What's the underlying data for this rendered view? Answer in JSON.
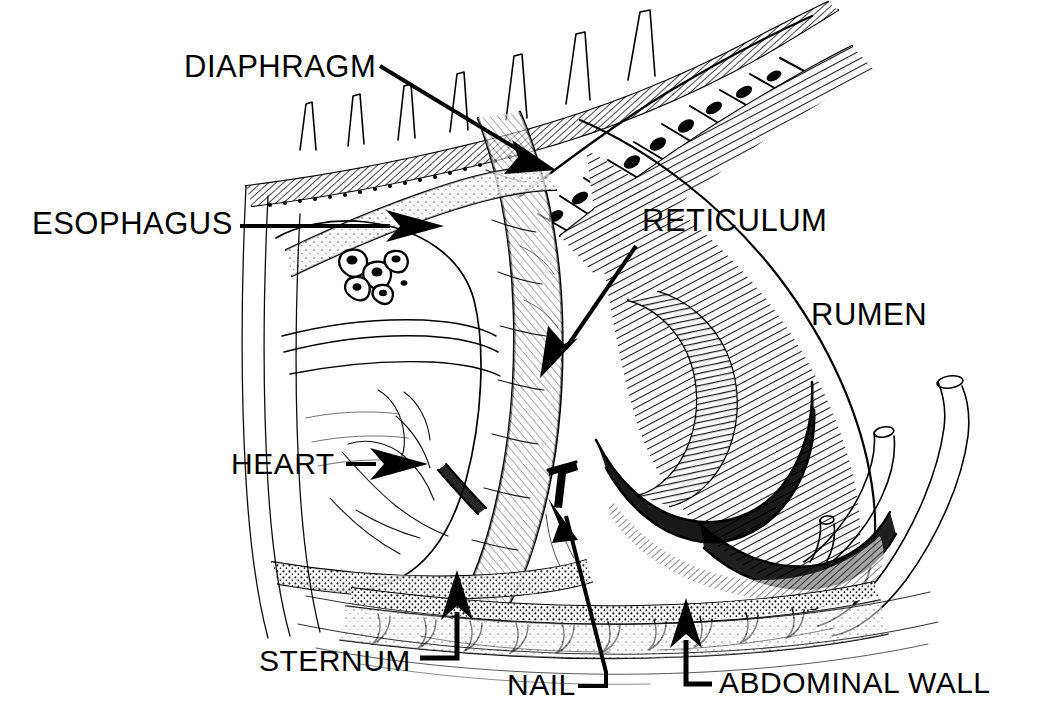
{
  "figure": {
    "style": "pen-and-ink line drawing",
    "background_color": "#FFFFFF",
    "ink_color": "#000000",
    "width": 1046,
    "height": 721
  },
  "labels": {
    "diaphragm": "DIAPHRAGM",
    "esophagus": "ESOPHAGUS",
    "reticulum": "RETICULUM",
    "rumen": "RUMEN",
    "heart": "HEART",
    "sternum": "STERNUM",
    "nail": "NAIL",
    "abdominal_wall": "ABDOMINAL WALL"
  },
  "leaders": [
    {
      "name": "diaphragm-leader",
      "kind": "diagonal-arrow",
      "arrowhead": true,
      "direction": "down-right"
    },
    {
      "name": "esophagus-leader",
      "kind": "horizontal-arrow",
      "arrowhead": true,
      "direction": "right"
    },
    {
      "name": "reticulum-leader",
      "kind": "diagonal-arrow",
      "arrowhead": true,
      "direction": "down-left"
    },
    {
      "name": "rumen-leader",
      "kind": "none",
      "arrowhead": false,
      "direction": ""
    },
    {
      "name": "heart-leader",
      "kind": "horizontal-arrow",
      "arrowhead": true,
      "direction": "right"
    },
    {
      "name": "sternum-leader",
      "kind": "elbow-arrow",
      "arrowhead": true,
      "direction": "up"
    },
    {
      "name": "nail-leader",
      "kind": "elbow-arrow",
      "arrowhead": true,
      "direction": "up-left"
    },
    {
      "name": "abdominal-wall-leader",
      "kind": "elbow-arrow",
      "arrowhead": true,
      "direction": "up"
    }
  ],
  "caption": {
    "partial_text": ""
  }
}
